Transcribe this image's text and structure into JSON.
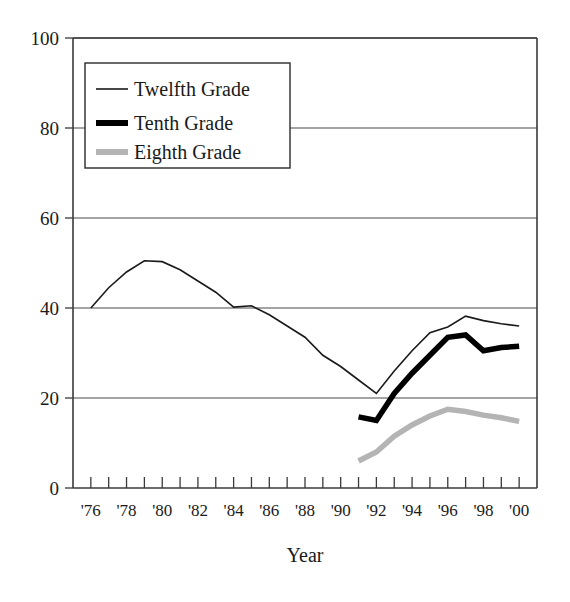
{
  "chart_data": {
    "type": "line",
    "title": "",
    "xlabel": "Year",
    "ylabel": "",
    "xlim": [
      1975,
      2001
    ],
    "ylim": [
      0,
      100
    ],
    "grid": true,
    "legend_position": "top-left",
    "x_tick_labels": [
      "'76",
      "'78",
      "'80",
      "'82",
      "'84",
      "'86",
      "'88",
      "'90",
      "'92",
      "'94",
      "'96",
      "'98",
      "'00"
    ],
    "x_tick_values": [
      1976,
      1978,
      1980,
      1982,
      1984,
      1986,
      1988,
      1990,
      1992,
      1994,
      1996,
      1998,
      2000
    ],
    "x_minor_ticks": [
      1975,
      1976,
      1977,
      1978,
      1979,
      1980,
      1981,
      1982,
      1983,
      1984,
      1985,
      1986,
      1987,
      1988,
      1989,
      1990,
      1991,
      1992,
      1993,
      1994,
      1995,
      1996,
      1997,
      1998,
      1999,
      2000,
      2001
    ],
    "y_tick_labels": [
      "0",
      "20",
      "40",
      "60",
      "80",
      "100"
    ],
    "y_tick_values": [
      0,
      20,
      40,
      60,
      80,
      100
    ],
    "series": [
      {
        "name": "Twelfth Grade",
        "color": "#1a1a1a",
        "width": 1.6,
        "x": [
          1976,
          1977,
          1978,
          1979,
          1980,
          1981,
          1982,
          1983,
          1984,
          1985,
          1986,
          1987,
          1988,
          1989,
          1990,
          1991,
          1992,
          1993,
          1994,
          1995,
          1996,
          1997,
          1998,
          1999,
          2000
        ],
        "values": [
          40.0,
          44.5,
          48.0,
          50.5,
          50.3,
          48.5,
          46.0,
          43.5,
          40.2,
          40.5,
          38.5,
          36.0,
          33.5,
          29.5,
          27.0,
          24.0,
          21.0,
          26.0,
          30.5,
          34.5,
          35.8,
          38.2,
          37.2,
          36.5,
          36.0
        ]
      },
      {
        "name": "Tenth Grade",
        "color": "#000000",
        "width": 5.5,
        "x": [
          1991,
          1992,
          1993,
          1994,
          1995,
          1996,
          1997,
          1998,
          1999,
          2000
        ],
        "values": [
          15.8,
          15.0,
          21.0,
          25.5,
          29.5,
          33.5,
          34.0,
          30.5,
          31.2,
          31.5
        ]
      },
      {
        "name": "Eighth Grade",
        "color": "#b4b4b4",
        "width": 5.5,
        "x": [
          1991,
          1992,
          1993,
          1994,
          1995,
          1996,
          1997,
          1998,
          1999,
          2000
        ],
        "values": [
          6.0,
          8.0,
          11.5,
          14.0,
          16.0,
          17.5,
          17.0,
          16.2,
          15.6,
          14.8
        ]
      }
    ]
  },
  "legend": {
    "items": [
      {
        "label": "Twelfth Grade"
      },
      {
        "label": "Tenth Grade"
      },
      {
        "label": "Eighth Grade"
      }
    ]
  },
  "axis": {
    "x_title": "Year"
  }
}
